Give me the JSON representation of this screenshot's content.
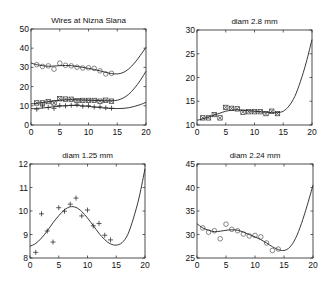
{
  "figure": {
    "width": 333,
    "height": 286,
    "background": "#ffffff",
    "line_color": "#222222"
  },
  "chart_data": [
    {
      "type": "line",
      "title": "Wires at Nizna Slana",
      "xlabel": "",
      "ylabel": "",
      "xlim": [
        0,
        20
      ],
      "ylim": [
        0,
        50
      ],
      "xticks": [
        0,
        5,
        10,
        15,
        20
      ],
      "yticks": [
        0,
        10,
        20,
        30,
        40,
        50
      ],
      "grid": false,
      "box": {
        "left": 31,
        "top": 29,
        "right": 146,
        "bottom": 125
      },
      "series": [
        {
          "name": "diam 2.24 mm data",
          "marker": "circle",
          "x": [
            1,
            2,
            3,
            4,
            5,
            6,
            7,
            8,
            9,
            10,
            11,
            12,
            13,
            14
          ],
          "y": [
            31.4,
            30.5,
            30.8,
            29.1,
            32.2,
            31.1,
            30.8,
            30.1,
            29.7,
            29.8,
            29.5,
            28.2,
            26.6,
            26.9
          ]
        },
        {
          "name": "diam 2.24 mm fit",
          "marker": "none",
          "x": [
            0,
            1,
            2,
            3,
            4,
            5,
            6,
            7,
            8,
            9,
            10,
            11,
            12,
            13,
            14,
            15,
            16,
            17,
            18,
            19,
            20
          ],
          "y": [
            32.3,
            31.4,
            30.9,
            30.6,
            30.7,
            30.9,
            31.0,
            30.9,
            30.5,
            30.0,
            29.5,
            28.9,
            28.2,
            27.4,
            26.8,
            26.6,
            27.3,
            29.2,
            32.3,
            36.2,
            40.5
          ]
        },
        {
          "name": "diam 2.8 mm data",
          "marker": "star",
          "x": [
            1,
            2,
            3,
            4,
            5,
            6,
            7,
            8,
            9,
            10,
            11,
            12,
            13,
            14
          ],
          "y": [
            11.5,
            11.5,
            12.2,
            11.5,
            13.7,
            13.5,
            13.4,
            12.7,
            12.8,
            12.8,
            12.8,
            12.4,
            12.9,
            12.4
          ]
        },
        {
          "name": "diam 2.8 mm fit",
          "marker": "none",
          "x": [
            0,
            1,
            2,
            3,
            4,
            5,
            6,
            7,
            8,
            9,
            10,
            11,
            12,
            13,
            14,
            15,
            16,
            17,
            18,
            19,
            20
          ],
          "y": [
            11.0,
            11.3,
            11.7,
            12.1,
            12.5,
            12.9,
            13.1,
            13.2,
            13.1,
            13.0,
            12.9,
            12.8,
            12.7,
            12.6,
            12.6,
            12.9,
            14.0,
            16.0,
            19.2,
            23.2,
            28.0
          ]
        },
        {
          "name": "diam 1.25 mm data",
          "marker": "plus",
          "x": [
            1,
            2,
            3,
            4,
            5,
            6,
            7,
            8,
            9,
            10,
            11,
            12,
            13,
            14
          ],
          "y": [
            8.24,
            9.88,
            9.15,
            8.68,
            10.14,
            9.99,
            10.29,
            10.55,
            9.79,
            10.04,
            9.37,
            9.47,
            8.97,
            8.77
          ]
        },
        {
          "name": "diam 1.25 mm fit",
          "marker": "none",
          "x": [
            0,
            1,
            2,
            3,
            4,
            5,
            6,
            7,
            8,
            9,
            10,
            11,
            12,
            13,
            14,
            15,
            16,
            17,
            18,
            19,
            20
          ],
          "y": [
            8.5,
            8.62,
            8.85,
            9.15,
            9.5,
            9.8,
            10.05,
            10.18,
            10.15,
            9.98,
            9.7,
            9.38,
            9.05,
            8.78,
            8.6,
            8.55,
            8.65,
            9.0,
            9.7,
            10.6,
            11.8
          ]
        }
      ]
    },
    {
      "type": "line",
      "title": "diam  2.8 mm",
      "xlabel": "",
      "ylabel": "",
      "xlim": [
        0,
        20
      ],
      "ylim": [
        10,
        30
      ],
      "xticks": [
        0,
        5,
        10,
        15,
        20
      ],
      "yticks": [
        10,
        15,
        20,
        25,
        30
      ],
      "grid": false,
      "box": {
        "left": 197,
        "top": 30,
        "right": 312,
        "bottom": 125
      },
      "series": [
        {
          "name": "data",
          "marker": "star",
          "x": [
            1,
            2,
            3,
            4,
            5,
            6,
            7,
            8,
            9,
            10,
            11,
            12,
            13,
            14
          ],
          "y": [
            11.5,
            11.5,
            12.2,
            11.5,
            13.7,
            13.5,
            13.4,
            12.7,
            12.8,
            12.8,
            12.8,
            12.4,
            12.9,
            12.4
          ]
        },
        {
          "name": "fit",
          "marker": "none",
          "x": [
            0,
            1,
            2,
            3,
            4,
            5,
            6,
            7,
            8,
            9,
            10,
            11,
            12,
            13,
            14,
            15,
            16,
            17,
            18,
            19,
            20
          ],
          "y": [
            11.0,
            11.3,
            11.7,
            12.1,
            12.5,
            12.9,
            13.1,
            13.2,
            13.1,
            13.0,
            12.9,
            12.8,
            12.7,
            12.6,
            12.6,
            12.9,
            14.0,
            16.0,
            19.2,
            23.2,
            28.0
          ]
        }
      ]
    },
    {
      "type": "line",
      "title": "diam  1.25 mm",
      "xlabel": "",
      "ylabel": "",
      "xlim": [
        0,
        20
      ],
      "ylim": [
        8,
        12
      ],
      "xticks": [
        0,
        5,
        10,
        15,
        20
      ],
      "yticks": [
        8,
        9,
        10,
        11,
        12
      ],
      "grid": false,
      "box": {
        "left": 30,
        "top": 164,
        "right": 145,
        "bottom": 258
      },
      "series": [
        {
          "name": "data",
          "marker": "plus",
          "x": [
            1,
            2,
            3,
            4,
            5,
            6,
            7,
            8,
            9,
            10,
            11,
            12,
            13,
            14
          ],
          "y": [
            8.24,
            9.88,
            9.15,
            8.68,
            10.14,
            9.99,
            10.29,
            10.55,
            9.79,
            10.04,
            9.37,
            9.47,
            8.97,
            8.77
          ]
        },
        {
          "name": "fit",
          "marker": "none",
          "x": [
            0,
            1,
            2,
            3,
            4,
            5,
            6,
            7,
            8,
            9,
            10,
            11,
            12,
            13,
            14,
            15,
            16,
            17,
            18,
            19,
            20
          ],
          "y": [
            8.5,
            8.62,
            8.85,
            9.15,
            9.5,
            9.8,
            10.05,
            10.18,
            10.15,
            9.98,
            9.7,
            9.38,
            9.05,
            8.78,
            8.6,
            8.55,
            8.65,
            9.0,
            9.7,
            10.6,
            11.8
          ]
        }
      ]
    },
    {
      "type": "line",
      "title": "diam  2.24 mm",
      "xlabel": "",
      "ylabel": "",
      "xlim": [
        0,
        20
      ],
      "ylim": [
        25,
        45
      ],
      "xticks": [
        0,
        5,
        10,
        15,
        20
      ],
      "yticks": [
        25,
        30,
        35,
        40,
        45
      ],
      "grid": false,
      "box": {
        "left": 197,
        "top": 164,
        "right": 313,
        "bottom": 258
      },
      "series": [
        {
          "name": "data",
          "marker": "circle",
          "x": [
            1,
            2,
            3,
            4,
            5,
            6,
            7,
            8,
            9,
            10,
            11,
            12,
            13,
            14
          ],
          "y": [
            31.4,
            30.5,
            30.8,
            29.1,
            32.2,
            31.1,
            30.8,
            30.1,
            29.7,
            29.8,
            29.5,
            28.2,
            26.6,
            26.9
          ]
        },
        {
          "name": "fit",
          "marker": "none",
          "x": [
            0,
            1,
            2,
            3,
            4,
            5,
            6,
            7,
            8,
            9,
            10,
            11,
            12,
            13,
            14,
            15,
            16,
            17,
            18,
            19,
            20
          ],
          "y": [
            32.3,
            31.4,
            30.9,
            30.6,
            30.7,
            30.9,
            31.0,
            30.9,
            30.5,
            30.0,
            29.5,
            28.9,
            28.2,
            27.4,
            26.8,
            26.6,
            27.3,
            29.2,
            32.3,
            36.2,
            40.5
          ]
        }
      ]
    }
  ]
}
